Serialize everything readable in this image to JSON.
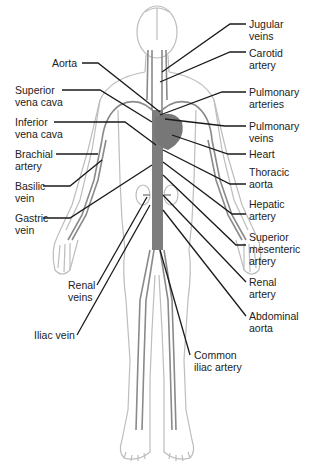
{
  "diagram": {
    "colors": {
      "background": "#ffffff",
      "body_outline": "#bdbdbd",
      "vessels": "#8a8a8a",
      "heart": "#7a7a7a",
      "leader_lines": "#1a1a1a",
      "text": "#222222"
    },
    "labels_left": [
      {
        "id": "aorta",
        "text": "Aorta"
      },
      {
        "id": "superior-vena-cava",
        "text": "Superior\nvena cava"
      },
      {
        "id": "inferior-vena-cava",
        "text": "Inferior\nvena cava"
      },
      {
        "id": "brachial-artery",
        "text": "Brachial\nartery"
      },
      {
        "id": "basilic-vein",
        "text": "Basilic\nvein"
      },
      {
        "id": "gastric-vein",
        "text": "Gastric\nvein"
      },
      {
        "id": "renal-veins",
        "text": "Renal\nveins"
      },
      {
        "id": "iliac-vein",
        "text": "Iliac vein"
      }
    ],
    "labels_right": [
      {
        "id": "jugular-veins",
        "text": "Jugular\nveins"
      },
      {
        "id": "carotid-artery",
        "text": "Carotid\nartery"
      },
      {
        "id": "pulmonary-arteries",
        "text": "Pulmonary\narteries"
      },
      {
        "id": "pulmonary-veins",
        "text": "Pulmonary\nveins"
      },
      {
        "id": "heart",
        "text": "Heart"
      },
      {
        "id": "thoracic-aorta",
        "text": "Thoracic\naorta"
      },
      {
        "id": "hepatic-artery",
        "text": "Hepatic\nartery"
      },
      {
        "id": "superior-mesenteric-artery",
        "text": "Superior\nmesenteric\nartery"
      },
      {
        "id": "renal-artery",
        "text": "Renal\nartery"
      },
      {
        "id": "abdominal-aorta",
        "text": "Abdominal\naorta"
      },
      {
        "id": "common-iliac-artery",
        "text": "Common\niliac artery"
      }
    ]
  }
}
